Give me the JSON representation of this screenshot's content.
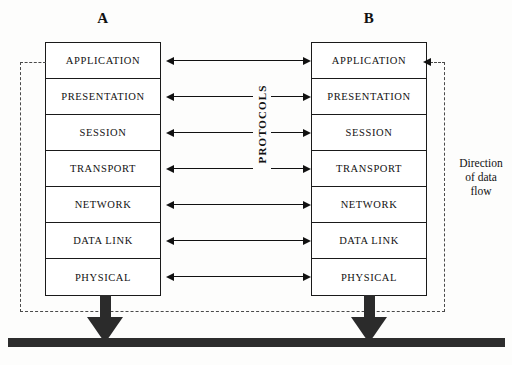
{
  "diagram": {
    "type": "layered-protocol-stack"
  },
  "hosts": [
    {
      "id": "a",
      "label": "A"
    },
    {
      "id": "b",
      "label": "B"
    }
  ],
  "layers": [
    {
      "index": 7,
      "name": "APPLICATION"
    },
    {
      "index": 6,
      "name": "PRESENTATION"
    },
    {
      "index": 5,
      "name": "SESSION"
    },
    {
      "index": 4,
      "name": "TRANSPORT"
    },
    {
      "index": 3,
      "name": "NETWORK"
    },
    {
      "index": 2,
      "name": "DATA LINK"
    },
    {
      "index": 1,
      "name": "PHYSICAL"
    }
  ],
  "annotations": {
    "protocols_label": "PROTOCOLS",
    "flow_label_line1": "Direction",
    "flow_label_line2": "of data",
    "flow_label_line3": "flow"
  },
  "colors": {
    "stroke": "#1a1a1a",
    "dashed": "#4a4a4a",
    "fill": "#2d2d2d",
    "background": "#fdfdfc"
  }
}
